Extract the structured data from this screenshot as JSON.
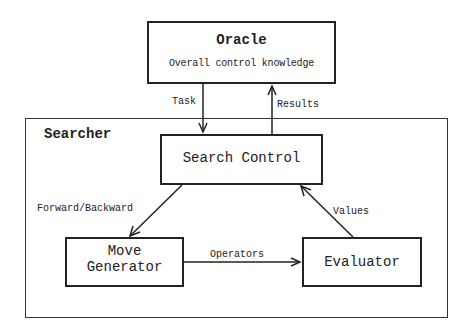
{
  "diagram": {
    "oracle": {
      "title": "Oracle",
      "subtitle": "Overall control knowledge"
    },
    "searcher": {
      "title": "Searcher"
    },
    "nodes": {
      "search_control": "Search Control",
      "move_generator_line1": "Move",
      "move_generator_line2": "Generator",
      "evaluator": "Evaluator"
    },
    "edges": {
      "task": "Task",
      "results": "Results",
      "forward_backward": "Forward/Backward",
      "operators": "Operators",
      "values": "Values"
    }
  }
}
